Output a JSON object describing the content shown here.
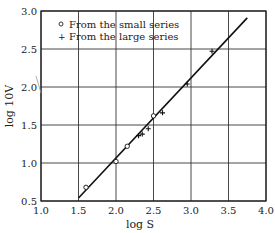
{
  "chart_data": {
    "type": "scatter",
    "title": "",
    "xlabel": "log S",
    "ylabel": "log 10V",
    "xlim": [
      1.0,
      4.0
    ],
    "ylim": [
      0.5,
      3.0
    ],
    "xticks": [
      "1.0",
      "1.5",
      "2.0",
      "2.5",
      "3.0",
      "3.5",
      "4.0"
    ],
    "yticks": [
      "0.5",
      "1.0",
      "1.5",
      "2.0",
      "2.5",
      "3.0"
    ],
    "grid": true,
    "legend_position": "upper left",
    "series": [
      {
        "name": "From the small series",
        "marker": "circle",
        "points": [
          [
            1.6,
            0.68
          ],
          [
            2.0,
            1.02
          ],
          [
            2.15,
            1.22
          ],
          [
            2.5,
            1.62
          ]
        ]
      },
      {
        "name": "From the large series",
        "marker": "plus",
        "points": [
          [
            2.3,
            1.36
          ],
          [
            2.35,
            1.38
          ],
          [
            2.43,
            1.45
          ],
          [
            2.62,
            1.66
          ],
          [
            2.95,
            2.04
          ],
          [
            3.28,
            2.47
          ]
        ]
      }
    ],
    "fit_line": {
      "x": [
        1.5,
        3.75
      ],
      "y": [
        0.54,
        2.91
      ]
    }
  },
  "legend": {
    "small": "From the small series",
    "large": "From the large series"
  },
  "axes": {
    "xlabel": "log S",
    "ylabel": "log 10V"
  }
}
